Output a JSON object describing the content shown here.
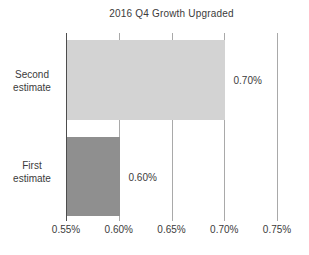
{
  "title": "2016 Q4 Growth Upgraded",
  "display": {
    "category_labels": [
      "Second\nestimate",
      "First\nestimate"
    ],
    "value_labels": [
      "0.70%",
      "0.60%"
    ]
  },
  "chart_data": {
    "type": "bar",
    "orientation": "horizontal",
    "title": "2016 Q4 Growth Upgraded",
    "categories": [
      "Second estimate",
      "First estimate"
    ],
    "values": [
      0.7,
      0.6
    ],
    "value_labels": [
      "0.70%",
      "0.60%"
    ],
    "xlabel": "",
    "ylabel": "",
    "xlim": [
      0.55,
      0.75
    ],
    "x_tick_labels": [
      "0.55%",
      "0.60%",
      "0.65%",
      "0.70%",
      "0.75%"
    ],
    "grid": true,
    "legend": false,
    "bar_colors": [
      "#d3d3d3",
      "#8f8f8f"
    ],
    "axis_color": "#4d4d4d",
    "gridline_color": "#a9a9a9",
    "text_color": "#3b3b3b"
  }
}
